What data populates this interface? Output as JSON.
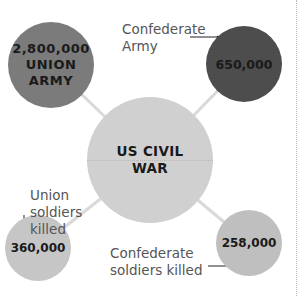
{
  "diagram": {
    "center": {
      "line1": "US CIVIL",
      "line2": "WAR"
    },
    "nodes": [
      {
        "id": "union-army",
        "value": "2,800,000",
        "line2": "UNION",
        "line3": "ARMY",
        "color": "#7b7b7b"
      },
      {
        "id": "confederate-army",
        "value": "650,000",
        "label": "Confederate Army",
        "label_line1": "Confederate",
        "label_line2": "Army",
        "color": "#4d4d4d"
      },
      {
        "id": "union-killed",
        "value": "360,000",
        "label": "Union soldiers killed",
        "label_line1": "Union",
        "label_line2": "soldiers",
        "label_line3": "killed",
        "color": "#c6c6c6"
      },
      {
        "id": "confederate-killed",
        "value": "258,000",
        "label": "Confederate soldiers killed",
        "label_line1": "Confederate",
        "label_line2": "soldiers killed",
        "color": "#bfbfbf"
      }
    ],
    "center_color": "#d0d0d0",
    "connector_color": "#d8d8d8"
  }
}
